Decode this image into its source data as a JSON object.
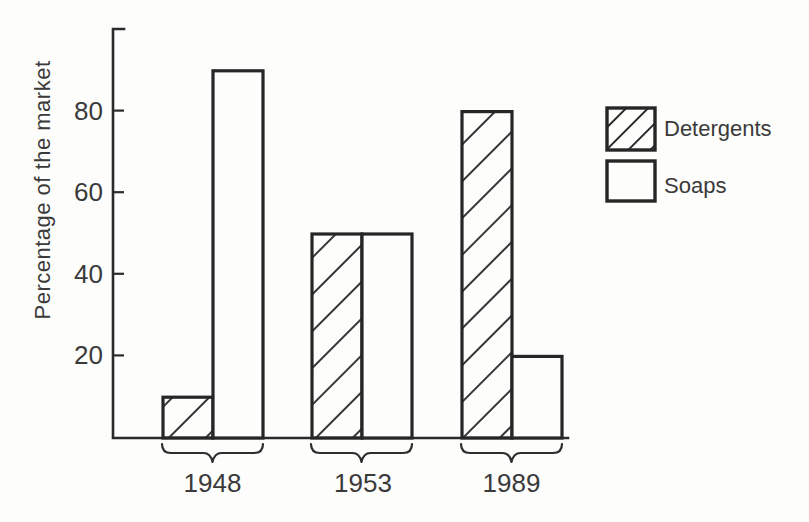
{
  "figure": {
    "kind": "scanned hand-drawn bar chart",
    "paper_color": "#fdfdfc",
    "ink_color": "#2b2b2b"
  },
  "chart_data": {
    "type": "bar",
    "title": "",
    "xlabel": "",
    "ylabel": "Percentage of the market",
    "ylim": [
      0,
      100
    ],
    "yticks": [
      20,
      40,
      60,
      80
    ],
    "grid": false,
    "legend_position": "right",
    "bar_fill": "#fdfdfc",
    "bar_outline": "#262626",
    "categories": [
      "1948",
      "1953",
      "1989"
    ],
    "series": [
      {
        "name": "Detergents",
        "pattern": "diagonal-hatch",
        "values": [
          10,
          50,
          80
        ]
      },
      {
        "name": "Soaps",
        "pattern": "plain",
        "values": [
          90,
          50,
          20
        ]
      }
    ]
  },
  "legend": {
    "items": [
      {
        "label": "Detergents",
        "swatch": "diagonal-hatch-icon"
      },
      {
        "label": "Soaps",
        "swatch": "plain-box-icon"
      }
    ]
  }
}
